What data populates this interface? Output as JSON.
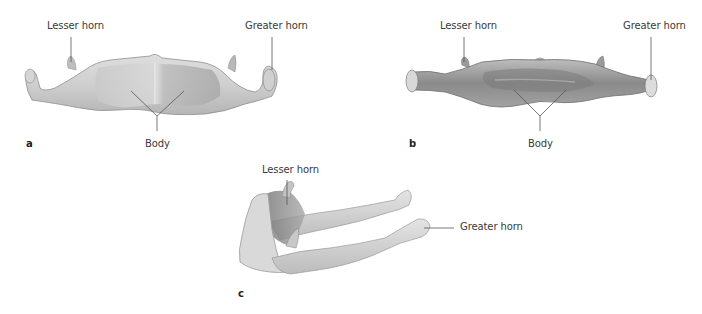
{
  "figure": {
    "panels": [
      {
        "id": "a",
        "letter": "a",
        "view": "anterior",
        "labels": {
          "lesser_horn": "Lesser horn",
          "greater_horn": "Greater horn",
          "body": "Body"
        }
      },
      {
        "id": "b",
        "letter": "b",
        "view": "posterior",
        "labels": {
          "lesser_horn": "Lesser horn",
          "greater_horn": "Greater horn",
          "body": "Body"
        }
      },
      {
        "id": "c",
        "letter": "c",
        "view": "lateral oblique",
        "labels": {
          "lesser_horn": "Lesser horn",
          "greater_horn": "Greater horn"
        }
      }
    ],
    "colors": {
      "background": "#ffffff",
      "label_text": "#3a3a3a",
      "leader_line": "#555555",
      "bone_light": "#e2e2e2",
      "bone_mid": "#c4c4c4",
      "bone_dark": "#8c8c8c",
      "bone_dark_b": "#7a7a7a"
    }
  }
}
